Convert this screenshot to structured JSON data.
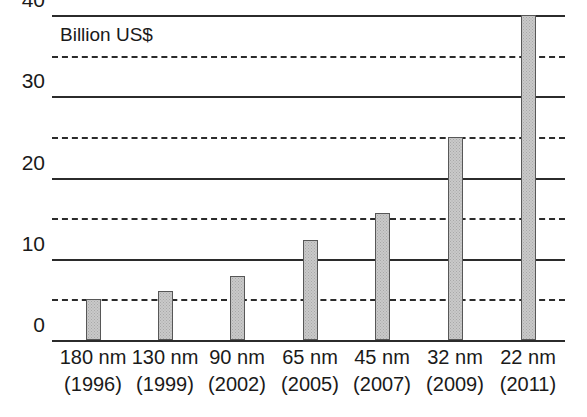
{
  "chart_data": {
    "type": "bar",
    "title": "",
    "annotation": "Billion US$",
    "xlabel": "",
    "ylabel": "Billion US$",
    "ylim": [
      0,
      40
    ],
    "grid": true,
    "legend": null,
    "y_major_ticks": [
      0,
      10,
      20,
      30,
      40
    ],
    "y_minor_ticks": [
      5,
      15,
      25,
      35
    ],
    "categories": [
      "180 nm (1996)",
      "130 nm (1999)",
      "90 nm (2002)",
      "65 nm (2005)",
      "45 nm (2007)",
      "32 nm (2009)",
      "22 nm (2011)"
    ],
    "category_lines": [
      {
        "node": "180 nm",
        "year": "(1996)"
      },
      {
        "node": "130 nm",
        "year": "(1999)"
      },
      {
        "node": "90 nm",
        "year": "(2002)"
      },
      {
        "node": "65 nm",
        "year": "(2005)"
      },
      {
        "node": "45 nm",
        "year": "(2007)"
      },
      {
        "node": "32 nm",
        "year": "(2009)"
      },
      {
        "node": "22 nm",
        "year": "(2011)"
      }
    ],
    "values": [
      5.0,
      6.0,
      7.9,
      12.3,
      15.6,
      25.0,
      40.0
    ],
    "units": "Billion US$",
    "colors": {
      "bar_fill": "#c9c9c9",
      "bar_stroke": "#575757",
      "gridline": "#2b2b2b",
      "text": "#1a1a1a",
      "background": "#ffffff"
    }
  }
}
